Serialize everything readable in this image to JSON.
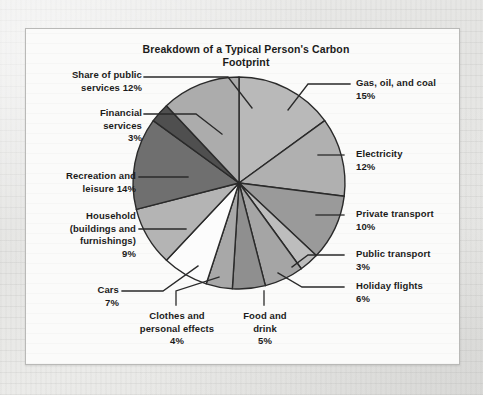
{
  "figure": {
    "title": "Breakdown of a Typical Person's\nCarbon Footprint"
  },
  "chart_data": {
    "type": "pie",
    "title": "Breakdown of a Typical Person's Carbon Footprint",
    "xlabel": "",
    "ylabel": "",
    "units": "percent",
    "total": 100,
    "legend_position": "callout-labels",
    "grid": false,
    "start_angle_deg": 0,
    "direction": "clockwise",
    "categories": [
      "Gas, oil, and coal",
      "Electricity",
      "Private transport",
      "Public transport",
      "Holiday flights",
      "Food and drink",
      "Clothes and personal effects",
      "Cars",
      "Household (buildings and furnishings)",
      "Recreation and leisure",
      "Financial services",
      "Share of public services"
    ],
    "values": [
      15,
      12,
      10,
      3,
      6,
      5,
      4,
      7,
      9,
      14,
      3,
      12
    ],
    "colors": [
      "#b9b9b9",
      "#b0b0b0",
      "#9a9a9a",
      "#bdbdbd",
      "#a5a5a5",
      "#8f8f8f",
      "#a8a8a8",
      "#fcfcfc",
      "#b4b4b4",
      "#6f6f6f",
      "#4f4f4f",
      "#acacac"
    ],
    "slices": [
      {
        "label": "Gas, oil, and coal",
        "value": 15,
        "value_text": "15%",
        "color": "#b9b9b9"
      },
      {
        "label": "Electricity",
        "value": 12,
        "value_text": "12%",
        "color": "#b0b0b0"
      },
      {
        "label": "Private transport",
        "value": 10,
        "value_text": "10%",
        "color": "#9a9a9a"
      },
      {
        "label": "Public transport",
        "value": 3,
        "value_text": "3%",
        "color": "#bdbdbd"
      },
      {
        "label": "Holiday flights",
        "value": 6,
        "value_text": "6%",
        "color": "#a5a5a5"
      },
      {
        "label": "Food and drink",
        "value": 5,
        "value_text": "5%",
        "color": "#8f8f8f"
      },
      {
        "label": "Clothes and personal effects",
        "value": 4,
        "value_text": "4%",
        "color": "#a8a8a8"
      },
      {
        "label": "Cars",
        "value": 7,
        "value_text": "7%",
        "color": "#fcfcfc"
      },
      {
        "label": "Household (buildings and furnishings)",
        "value": 9,
        "value_text": "9%",
        "color": "#b4b4b4"
      },
      {
        "label": "Recreation and leisure",
        "value": 14,
        "value_text": "14%",
        "color": "#6f6f6f"
      },
      {
        "label": "Financial services",
        "value": 3,
        "value_text": "3%",
        "color": "#4f4f4f"
      },
      {
        "label": "Share of public services",
        "value": 12,
        "value_text": "12%",
        "color": "#acacac"
      }
    ]
  },
  "labels": {
    "share_of_public_services": "Share of public\nservices 12%",
    "financial_services": "Financial\nservices\n3%",
    "recreation_and_leisure": "Recreation and\nleisure 14%",
    "household": "Household\n(buildings and\nfurnishings)\n9%",
    "cars": "Cars\n7%",
    "clothes": "Clothes and\npersonal effects\n4%",
    "food_and_drink": "Food and\ndrink\n5%",
    "gas_oil_coal": "Gas, oil, and coal\n15%",
    "electricity": "Electricity\n12%",
    "private_transport": "Private transport\n10%",
    "public_transport": "Public transport\n3%",
    "holiday_flights": "Holiday flights\n6%"
  },
  "style": {
    "stroke": "#2a2a2a",
    "paper": "#e8e8e6",
    "panel": "#fbfbfa",
    "text": "#1b1b1b"
  }
}
